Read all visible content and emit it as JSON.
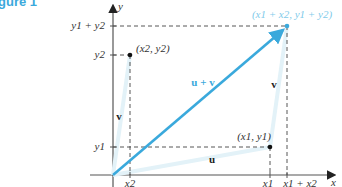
{
  "figure": {
    "title": "gure 1"
  },
  "axes": {
    "x_label": "x",
    "y_label": "y"
  },
  "tick_labels": {
    "y_axis": [
      "y1 + y2",
      "y2",
      "y1"
    ],
    "x_axis": [
      "x2",
      "x1",
      "x1 + x2"
    ]
  },
  "points": {
    "p1": "(x1, y1)",
    "p2": "(x2, y2)",
    "sum": "(x1 + x2, y1 + y2)"
  },
  "vectors": {
    "u": "u",
    "v_left": "v",
    "v_right": "v",
    "sum": "u + v"
  },
  "colors": {
    "accent": "#3aa9dc",
    "axis": "#555555",
    "faint_vector": "#e3f2f8"
  }
}
